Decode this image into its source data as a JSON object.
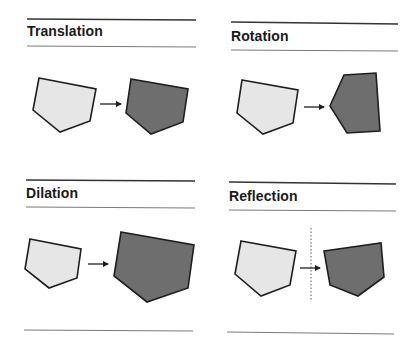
{
  "colors": {
    "light_fill": "#e6e6e6",
    "dark_fill": "#6e6e6e",
    "stroke": "#1e1e1e",
    "rule_top": "#333333",
    "rule_bottom": "#7a7a7a",
    "reflection_axis": "#777777"
  },
  "panels": [
    {
      "id": "translation",
      "title": "Translation",
      "title_pos": [
        27,
        23
      ],
      "rules": [
        [
          27,
          19,
          196,
          20,
          "top"
        ],
        [
          27,
          46,
          196,
          47,
          "bottom"
        ]
      ],
      "original": [
        [
          39,
          78
        ],
        [
          96,
          89
        ],
        [
          90,
          121
        ],
        [
          60,
          132
        ],
        [
          33,
          110
        ]
      ],
      "image": [
        [
          131,
          79
        ],
        [
          188,
          89
        ],
        [
          183,
          122
        ],
        [
          151,
          134
        ],
        [
          126,
          113
        ]
      ],
      "arrow": [
        100,
        104,
        121,
        104
      ]
    },
    {
      "id": "rotation",
      "title": "Rotation",
      "title_pos": [
        231,
        28
      ],
      "rules": [
        [
          231,
          22,
          398,
          24,
          "top"
        ],
        [
          231,
          50,
          398,
          51,
          "bottom"
        ]
      ],
      "original": [
        [
          242,
          80
        ],
        [
          298,
          90
        ],
        [
          293,
          123
        ],
        [
          263,
          134
        ],
        [
          237,
          113
        ]
      ],
      "image": [
        [
          344,
          75
        ],
        [
          376,
          73
        ],
        [
          380,
          131
        ],
        [
          347,
          133
        ],
        [
          330,
          106
        ]
      ],
      "arrow": [
        304,
        107,
        324,
        107
      ]
    },
    {
      "id": "dilation",
      "title": "Dilation",
      "title_pos": [
        26,
        185
      ],
      "rules": [
        [
          26,
          180,
          195,
          181,
          "top"
        ],
        [
          26,
          207,
          195,
          208,
          "bottom"
        ],
        [
          24,
          330,
          193,
          331,
          "bottom"
        ]
      ],
      "original": [
        [
          30,
          239
        ],
        [
          81,
          249
        ],
        [
          77,
          278
        ],
        [
          49,
          288
        ],
        [
          25,
          269
        ]
      ],
      "image": [
        [
          121,
          232
        ],
        [
          194,
          245
        ],
        [
          188,
          288
        ],
        [
          147,
          302
        ],
        [
          114,
          276
        ]
      ],
      "arrow": [
        88,
        264,
        108,
        264
      ]
    },
    {
      "id": "reflection",
      "title": "Reflection",
      "title_pos": [
        229,
        188
      ],
      "rules": [
        [
          229,
          182,
          396,
          184,
          "top"
        ],
        [
          229,
          210,
          396,
          211,
          "bottom"
        ],
        [
          227,
          332,
          394,
          334,
          "bottom"
        ]
      ],
      "original": [
        [
          241,
          241
        ],
        [
          296,
          251
        ],
        [
          290,
          285
        ],
        [
          261,
          296
        ],
        [
          235,
          274
        ]
      ],
      "image": [
        [
          324,
          251
        ],
        [
          381,
          243
        ],
        [
          384,
          277
        ],
        [
          358,
          296
        ],
        [
          330,
          285
        ]
      ],
      "arrow": [
        300,
        268,
        320,
        268
      ],
      "axis": [
        311,
        228,
        311,
        301
      ]
    }
  ]
}
